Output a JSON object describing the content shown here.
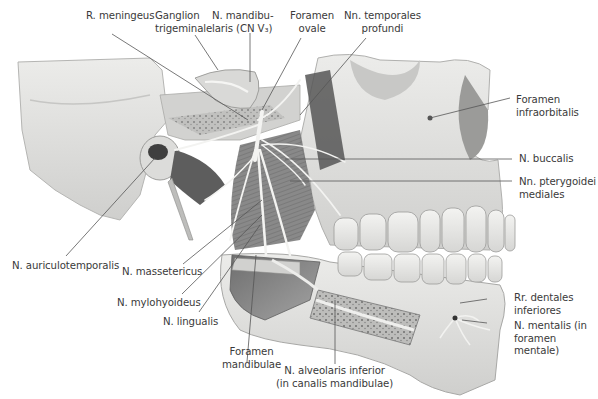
{
  "figure": {
    "type": "anatomical illustration",
    "top_caption_partial": "",
    "signature": "A. Wulf"
  },
  "labels": {
    "r_meningeus": "R. meningeus",
    "ganglion_line1": "Ganglion",
    "ganglion_line2": "trigeminale",
    "mandibularis_line1": "N. mandibu-",
    "mandibularis_line2": "laris (CN V₃)",
    "foramen_ovale_line1": "Foramen",
    "foramen_ovale_line2": "ovale",
    "temporales_line1": "Nn. temporales",
    "temporales_line2": "profundi",
    "infraorbitalis_line1": "Foramen",
    "infraorbitalis_line2": "infraorbitalis",
    "buccalis": "N. buccalis",
    "pterygoidei_line1": "Nn. pterygoidei",
    "pterygoidei_line2": "mediales",
    "auriculotemporalis": "N. auriculotemporalis",
    "massetericus": "N. massetericus",
    "mylohyoideus": "N. mylohyoideus",
    "lingualis": "N. lingualis",
    "foramen_mandibulae_line1": "Foramen",
    "foramen_mandibulae_line2": "mandibulae",
    "alveolaris_line1": "N. alveolaris inferior",
    "alveolaris_line2": "(in canalis mandibulae)",
    "dentales_line1": "Rr. dentales",
    "dentales_line2": "inferiores",
    "mentalis_line1": "N. mentalis (in",
    "mentalis_line2": "foramen",
    "mentalis_line3": "mentale)"
  },
  "colors": {
    "background": "#ffffff",
    "label_text": "#3a3a3a",
    "leader_line": "#555555",
    "bone": "#e4e4e2",
    "bone_shadow": "#b9b9b7",
    "muscle": "#8a8a8a",
    "nerve": "#f4f4f2"
  }
}
